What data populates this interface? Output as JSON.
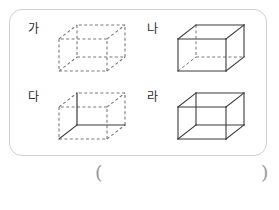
{
  "worksheet": {
    "panel_border_color": "#cfcfcf",
    "background_color": "#ffffff",
    "line_color": "#3a3a3a",
    "dash_color": "#7a7a7a",
    "paren_color": "#9a9a9a"
  },
  "figures": [
    {
      "label": "가",
      "name": "cube-ga",
      "edge_style": "all-dashed",
      "description": "all twelve edges dashed"
    },
    {
      "label": "나",
      "name": "cube-na",
      "edge_style": "solid-visible-dashed-hidden",
      "description": "visible edges solid, hidden edges dashed"
    },
    {
      "label": "다",
      "name": "cube-da",
      "edge_style": "dashed-visible-solid-hidden",
      "description": "visible edges dashed, hidden edges solid"
    },
    {
      "label": "라",
      "name": "cube-ra",
      "edge_style": "all-solid",
      "description": "all twelve edges solid"
    }
  ],
  "answer": {
    "open_paren": "(",
    "close_paren": ")",
    "value": ""
  }
}
